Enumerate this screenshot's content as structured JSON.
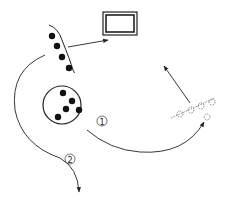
{
  "diagram": {
    "labels": {
      "path1": "①",
      "path2": "②"
    },
    "colors": {
      "stroke": "#222222",
      "dot": "#111111",
      "dashed": "#555555",
      "background": "#ffffff"
    },
    "elements": {
      "screen_box": "display-box",
      "bracket_group_dots": 4,
      "circle_group_dots": 5,
      "dashed_group_dots": 5
    }
  }
}
